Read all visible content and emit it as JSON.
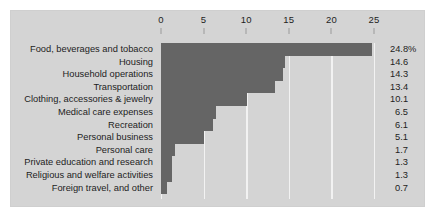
{
  "chart_data": {
    "type": "bar",
    "orientation": "horizontal",
    "title": "",
    "subtitle": "",
    "xlabel": "",
    "ylabel": "",
    "xlim": [
      0,
      25
    ],
    "xticks": [
      0,
      5,
      10,
      15,
      20,
      25
    ],
    "xtick_labels": [
      "0",
      "5",
      "10",
      "15",
      "20",
      "25"
    ],
    "grid": true,
    "grid_axis": "x",
    "legend": false,
    "legend_position": "none",
    "categories": [
      "Food, beverages and tobacco",
      "Housing",
      "Household operations",
      "Transportation",
      "Clothing, accessories & jewelry",
      "Medical care expenses",
      "Recreation",
      "Personal business",
      "Personal care",
      "Private education and research",
      "Religious and welfare activities",
      "Foreign travel, and other"
    ],
    "values": [
      24.8,
      14.6,
      14.3,
      13.4,
      10.1,
      6.5,
      6.1,
      5.1,
      1.7,
      1.3,
      1.3,
      0.7
    ],
    "value_labels": [
      "24.8%",
      "14.6",
      "14.3",
      "13.4",
      "10.1",
      "6.5",
      "6.1",
      "5.1",
      "1.7",
      "1.3",
      "1.3",
      "0.7"
    ],
    "units": "percent",
    "colors": {
      "bar": "#656565",
      "plot_background": "#d4d4d4",
      "panel_background": "#d4d4d4",
      "gridline": "#f2f2f2",
      "text": "#1d1d1d",
      "page_background": "#ffffff"
    }
  }
}
